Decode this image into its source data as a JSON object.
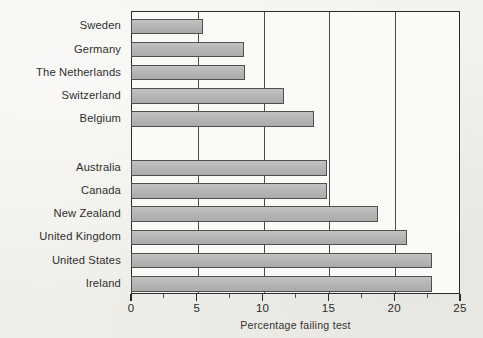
{
  "chart_data": {
    "type": "bar",
    "orientation": "horizontal",
    "title": "",
    "xlabel": "Percentage failing test",
    "ylabel": "",
    "xlim": [
      0,
      25
    ],
    "xticks": [
      0,
      5,
      10,
      15,
      20,
      25
    ],
    "xticklabels": [
      "0",
      "5",
      "10",
      "15",
      "20",
      "25"
    ],
    "minor_tick_interval": 2.5,
    "grid": "vertical",
    "legend": "none",
    "bar_color": "#b9b9b9",
    "bar_edge_color": "#4f4f4f",
    "groups": [
      {
        "name": "group-1",
        "categories": [
          "Sweden",
          "Germany",
          "The Netherlands",
          "Switzerland",
          "Belgium"
        ],
        "values": [
          5.5,
          8.6,
          8.7,
          11.6,
          13.9
        ]
      },
      {
        "name": "group-2",
        "categories": [
          "Australia",
          "Canada",
          "New Zealand",
          "United Kingdom",
          "United States",
          "Ireland"
        ],
        "values": [
          14.9,
          14.9,
          18.8,
          21.0,
          22.9,
          22.9
        ]
      }
    ],
    "categories": [
      "Sweden",
      "Germany",
      "The Netherlands",
      "Switzerland",
      "Belgium",
      "Australia",
      "Canada",
      "New Zealand",
      "United Kingdom",
      "United States",
      "Ireland"
    ],
    "values": [
      5.5,
      8.6,
      8.7,
      11.6,
      13.9,
      14.9,
      14.9,
      18.8,
      21.0,
      22.9,
      22.9
    ]
  }
}
